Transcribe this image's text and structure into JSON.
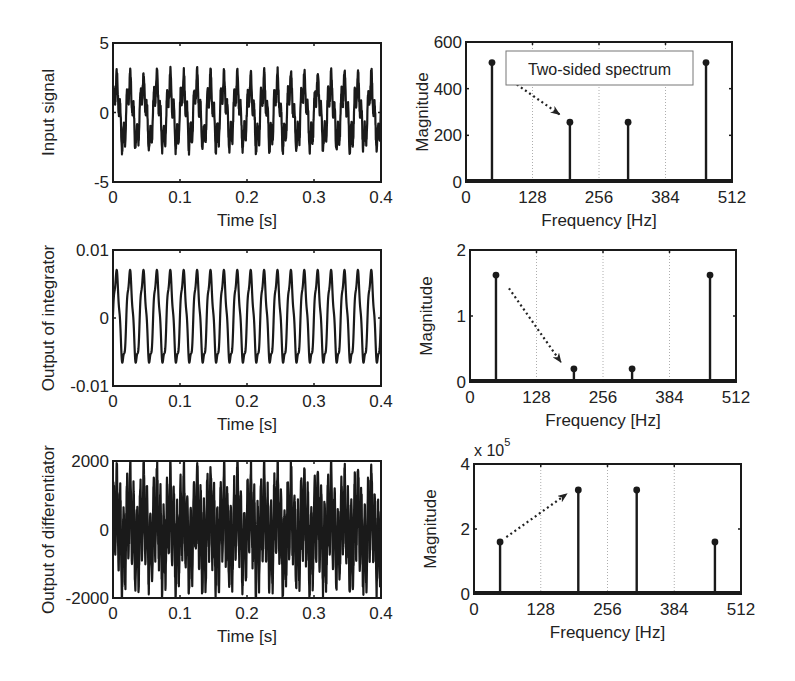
{
  "figure": {
    "panels": [
      {
        "id": "input-time",
        "ylabel": "Input signal",
        "xlabel": "Time [s]"
      },
      {
        "id": "input-spectrum",
        "ylabel": "Magnitude",
        "xlabel": "Frequency [Hz]",
        "annotation": "Two-sided spectrum"
      },
      {
        "id": "integrator-time",
        "ylabel": "Output of integrator",
        "xlabel": "Time [s]"
      },
      {
        "id": "integrator-spectrum",
        "ylabel": "Magnitude",
        "xlabel": "Frequency [Hz]"
      },
      {
        "id": "differentiator-time",
        "ylabel": "Output of differentiator",
        "xlabel": "Time [s]"
      },
      {
        "id": "differentiator-spectrum",
        "ylabel": "Magnitude",
        "xlabel": "Frequency [Hz]",
        "exponent_label": "x 10",
        "exponent": "5"
      }
    ]
  },
  "chart_data": [
    {
      "type": "line",
      "title": "",
      "xlabel": "Time [s]",
      "ylabel": "Input signal",
      "xlim": [
        0,
        0.4
      ],
      "ylim": [
        -5,
        5
      ],
      "xticks": [
        "0",
        "0.1",
        "0.2",
        "0.3",
        "0.4"
      ],
      "yticks": [
        "-5",
        "0",
        "5"
      ],
      "signal": {
        "components": [
          {
            "freq_hz": 50,
            "amp": 2.0
          },
          {
            "freq_hz": 200,
            "amp": 1.0
          }
        ],
        "noise_amp": 0.35
      },
      "grid": false
    },
    {
      "type": "stem",
      "xlabel": "Frequency [Hz]",
      "ylabel": "Magnitude",
      "xlim": [
        0,
        512
      ],
      "ylim": [
        0,
        600
      ],
      "xticks": [
        "0",
        "128",
        "256",
        "384",
        "512"
      ],
      "yticks": [
        "0",
        "200",
        "400",
        "600"
      ],
      "x": [
        50,
        200,
        312,
        462
      ],
      "values": [
        512,
        256,
        256,
        512
      ],
      "grid": "vertical-dotted",
      "annotation": {
        "text": "Two-sided spectrum",
        "arrow_from": [
          90,
          430
        ],
        "arrow_to": [
          180,
          290
        ]
      }
    },
    {
      "type": "line",
      "xlabel": "Time [s]",
      "ylabel": "Output of integrator",
      "xlim": [
        0,
        0.4
      ],
      "ylim": [
        -0.01,
        0.01
      ],
      "xticks": [
        "0",
        "0.1",
        "0.2",
        "0.3",
        "0.4"
      ],
      "yticks": [
        "-0.01",
        "0",
        "0.01"
      ],
      "signal": {
        "components": [
          {
            "freq_hz": 50,
            "amp": 0.0064
          },
          {
            "freq_hz": 200,
            "amp": 0.0008
          }
        ],
        "noise_amp": 0.0
      },
      "grid": false
    },
    {
      "type": "stem",
      "xlabel": "Frequency [Hz]",
      "ylabel": "Magnitude",
      "xlim": [
        0,
        512
      ],
      "ylim": [
        0,
        2
      ],
      "xticks": [
        "0",
        "128",
        "256",
        "384",
        "512"
      ],
      "yticks": [
        "0",
        "1",
        "2"
      ],
      "x": [
        50,
        200,
        312,
        462
      ],
      "values": [
        1.62,
        0.2,
        0.2,
        1.62
      ],
      "grid": "vertical-dotted",
      "annotation": {
        "text": "",
        "arrow_from": [
          75,
          1.42
        ],
        "arrow_to": [
          175,
          0.3
        ]
      }
    },
    {
      "type": "line",
      "xlabel": "Time [s]",
      "ylabel": "Output of differentiator",
      "xlim": [
        0,
        0.4
      ],
      "ylim": [
        -2000,
        2000
      ],
      "xticks": [
        "0",
        "0.1",
        "0.2",
        "0.3",
        "0.4"
      ],
      "yticks": [
        "-2000",
        "0",
        "2000"
      ],
      "signal": {
        "components": [
          {
            "freq_hz": 50,
            "amp": 630
          },
          {
            "freq_hz": 200,
            "amp": 1260
          }
        ],
        "noise_amp": 300
      },
      "grid": false
    },
    {
      "type": "stem",
      "xlabel": "Frequency [Hz]",
      "ylabel": "Magnitude",
      "xlim": [
        0,
        512
      ],
      "ylim": [
        0,
        400000
      ],
      "xticks": [
        "0",
        "128",
        "256",
        "384",
        "512"
      ],
      "yticks": [
        "0",
        "2",
        "4"
      ],
      "y_multiplier": "x 10^5",
      "x": [
        50,
        200,
        312,
        462
      ],
      "values": [
        160000,
        320000,
        320000,
        160000
      ],
      "grid": "vertical-dotted",
      "annotation": {
        "text": "",
        "arrow_from": [
          62,
          175000
        ],
        "arrow_to": [
          178,
          308000
        ]
      }
    }
  ]
}
